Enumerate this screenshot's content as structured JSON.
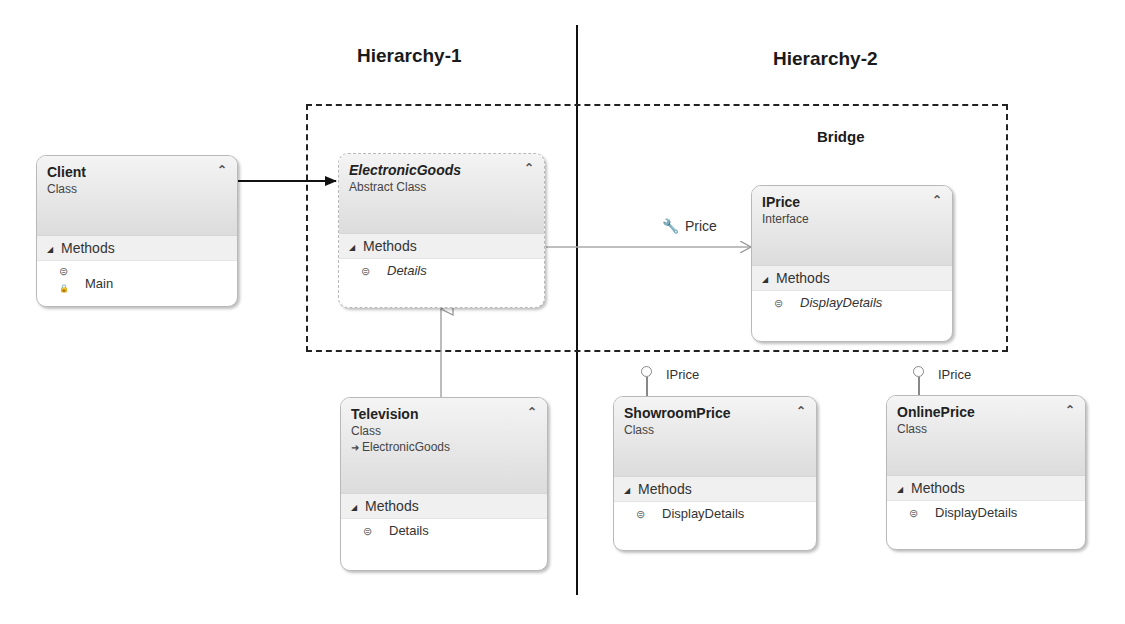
{
  "headings": {
    "hierarchy1": "Hierarchy-1",
    "hierarchy2": "Hierarchy-2",
    "bridge": "Bridge"
  },
  "classes": {
    "client": {
      "name": "Client",
      "kind": "Class",
      "section": "Methods",
      "members": [
        {
          "name": "Main",
          "icon": "private-method-icon"
        }
      ]
    },
    "electronic_goods": {
      "name": "ElectronicGoods",
      "kind": "Abstract Class",
      "section": "Methods",
      "members": [
        {
          "name": "Details",
          "icon": "abstract-method-icon"
        }
      ]
    },
    "iprice": {
      "name": "IPrice",
      "kind": "Interface",
      "section": "Methods",
      "members": [
        {
          "name": "DisplayDetails",
          "icon": "abstract-method-icon"
        }
      ]
    },
    "television": {
      "name": "Television",
      "kind": "Class",
      "base": "ElectronicGoods",
      "section": "Methods",
      "members": [
        {
          "name": "Details",
          "icon": "method-icon"
        }
      ]
    },
    "showroom_price": {
      "name": "ShowroomPrice",
      "kind": "Class",
      "implements": "IPrice",
      "section": "Methods",
      "members": [
        {
          "name": "DisplayDetails",
          "icon": "method-icon"
        }
      ]
    },
    "online_price": {
      "name": "OnlinePrice",
      "kind": "Class",
      "implements": "IPrice",
      "section": "Methods",
      "members": [
        {
          "name": "DisplayDetails",
          "icon": "method-icon"
        }
      ]
    }
  },
  "associations": {
    "price_label": "Price"
  },
  "glyphs": {
    "collapse": "⌃",
    "triangle": "◢",
    "method": "⊜",
    "base_arrow": "➜",
    "wrench": "🔧"
  }
}
